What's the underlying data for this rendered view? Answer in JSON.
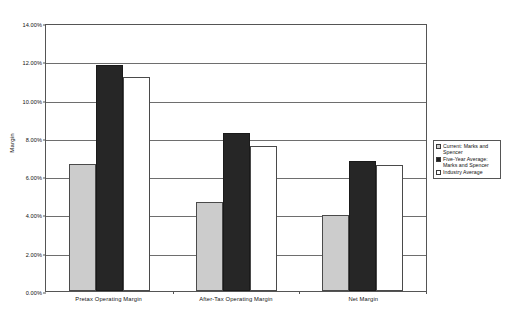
{
  "chart_data": {
    "type": "bar",
    "title": "",
    "xlabel": "",
    "ylabel": "Margin",
    "ylim": [
      0,
      14
    ],
    "ytick_labels": [
      "0.00%",
      "2.00%",
      "4.00%",
      "6.00%",
      "8.00%",
      "10.00%",
      "12.00%",
      "14.00%"
    ],
    "ytick_values": [
      0,
      2,
      4,
      6,
      8,
      10,
      12,
      14
    ],
    "grid": true,
    "legend_position": "right",
    "categories": [
      "Pretax  Operating Margin",
      "After-Tax Operating Margin",
      "Net Margin"
    ],
    "series": [
      {
        "name": "Current: Marks and Spencer",
        "color": "#cccccc",
        "values": [
          6.65,
          4.65,
          3.95
        ]
      },
      {
        "name": "Five-Year Average: Marks and Spencer",
        "color": "#262626",
        "values": [
          11.8,
          8.25,
          6.8
        ]
      },
      {
        "name": "Industry Average",
        "color": "#ffffff",
        "values": [
          11.2,
          7.6,
          6.6
        ]
      }
    ]
  },
  "legend": {
    "items": [
      {
        "label": "Current: Marks and Spencer",
        "swatch": "current"
      },
      {
        "label": "Five-Year Average: Marks and Spencer",
        "swatch": "fiveyear"
      },
      {
        "label": "Industry Average",
        "swatch": "industry"
      }
    ]
  }
}
